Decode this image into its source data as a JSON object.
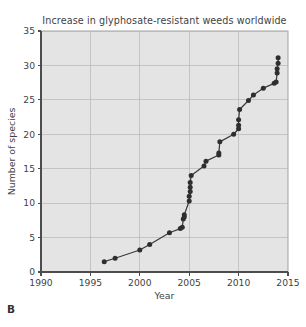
{
  "figure": {
    "panel_letter": "B"
  },
  "chart_data": {
    "type": "scatter",
    "title": "Increase in glyphosate-resistant weeds worldwide",
    "xlabel": "Year",
    "ylabel": "Number of species",
    "xlim": [
      1990,
      2015
    ],
    "ylim": [
      0,
      35
    ],
    "xticks": [
      1990,
      1995,
      2000,
      2005,
      2010,
      2015
    ],
    "yticks": [
      0,
      5,
      10,
      15,
      20,
      25,
      30,
      35
    ],
    "xtick_labels": [
      "1990",
      "1995",
      "2000",
      "2005",
      "2010",
      "2015"
    ],
    "ytick_labels": [
      "0",
      "5",
      "10",
      "15",
      "20",
      "25",
      "30",
      "35"
    ],
    "grid": true,
    "legend": false,
    "marker": "filled-circle",
    "line": "connected",
    "plot_bgcolor": "#e4e4e4",
    "line_color": "#3b3b3b",
    "marker_color": "#2e2e2e",
    "x": [
      1996.4,
      1997.5,
      2000.0,
      2001.0,
      2003.0,
      2004.1,
      2004.3,
      2004.4,
      2004.5,
      2004.5,
      2005.0,
      2005.0,
      2005.1,
      2005.1,
      2005.1,
      2005.2,
      2006.5,
      2006.7,
      2008.0,
      2008.0,
      2008.1,
      2009.5,
      2010.0,
      2010.0,
      2010.0,
      2010.1,
      2011.0,
      2011.5,
      2012.5,
      2013.6,
      2013.8,
      2013.9,
      2013.9,
      2014.0,
      2014.0
    ],
    "y": [
      1.5,
      2.0,
      3.2,
      4.0,
      5.7,
      6.3,
      6.5,
      7.7,
      8.0,
      8.3,
      10.3,
      11.0,
      11.7,
      12.3,
      13.0,
      14.0,
      15.4,
      16.1,
      17.0,
      17.3,
      18.9,
      20.0,
      20.8,
      21.3,
      22.1,
      23.6,
      24.9,
      25.7,
      26.7,
      27.4,
      27.6,
      28.9,
      29.5,
      30.3,
      31.1
    ],
    "n_points": 35,
    "value_range": {
      "first_year": 1996,
      "first_count": 1.5,
      "last_year": 2014,
      "last_count": 31
    }
  }
}
